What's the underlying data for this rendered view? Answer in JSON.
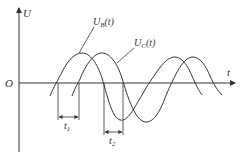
{
  "diagram": {
    "axes": {
      "y_label": "U",
      "x_label": "t",
      "origin_label": "O"
    },
    "curves": [
      {
        "name": "U_B(t)",
        "label_main": "U",
        "label_sub": "B",
        "label_arg": "(t)"
      },
      {
        "name": "U_C(t)",
        "label_main": "U",
        "label_sub": "C",
        "label_arg": "(t)"
      }
    ],
    "intervals": [
      {
        "name": "t1",
        "label_main": "t",
        "label_sub": "1"
      },
      {
        "name": "t2",
        "label_main": "t",
        "label_sub": "2"
      }
    ],
    "colors": {
      "line": "#333333",
      "background": "#ffffff"
    }
  }
}
